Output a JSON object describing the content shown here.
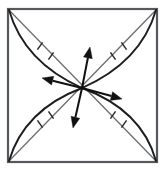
{
  "figure": {
    "background_color": "#ffffff",
    "frame_color": "#55585c",
    "diagonal_color": "#6b6e72",
    "arc_color": "#1d1d1d",
    "vector_color": "#111111",
    "tick_color": "#2a2a2a"
  },
  "chart_data": {
    "type": "diagram",
    "xlabel": "",
    "ylabel": "",
    "xlim": [
      0,
      165
    ],
    "ylim": [
      0,
      177
    ],
    "grid": false,
    "legend": "none",
    "annotations": [],
    "frame": {
      "name": "outer-square",
      "left": 8,
      "top": 9,
      "right": 157,
      "bottom": 162,
      "stroke_width": 2.2
    },
    "center": {
      "x": 82,
      "y": 88
    },
    "diagonals": [
      {
        "name": "diagonal-top-left-to-bottom-right",
        "from": {
          "x": 9,
          "y": 10
        },
        "to": {
          "x": 156,
          "y": 161
        }
      },
      {
        "name": "diagonal-top-right-to-bottom-left",
        "from": {
          "x": 156,
          "y": 10
        },
        "to": {
          "x": 9,
          "y": 161
        }
      }
    ],
    "arcs": [
      {
        "name": "arc-top-left",
        "from": {
          "x": 9,
          "y": 10
        },
        "to": {
          "x": 82,
          "y": 88
        },
        "control": {
          "x": 24,
          "y": 62
        },
        "bow": "outward-left"
      },
      {
        "name": "arc-bottom-right",
        "from": {
          "x": 82,
          "y": 88
        },
        "to": {
          "x": 156,
          "y": 161
        },
        "control": {
          "x": 142,
          "y": 110
        },
        "bow": "outward-right"
      },
      {
        "name": "arc-top-right",
        "from": {
          "x": 156,
          "y": 10
        },
        "to": {
          "x": 82,
          "y": 88
        },
        "control": {
          "x": 141,
          "y": 62
        },
        "bow": "outward-right"
      },
      {
        "name": "arc-bottom-left",
        "from": {
          "x": 82,
          "y": 88
        },
        "to": {
          "x": 9,
          "y": 161
        },
        "control": {
          "x": 24,
          "y": 110
        },
        "bow": "outward-left"
      }
    ],
    "tick_marks": [
      {
        "name": "tick-top-left-outer",
        "x": 40,
        "y": 46,
        "angle_deg": 55,
        "length": 9
      },
      {
        "name": "tick-top-left-inner",
        "x": 51,
        "y": 56,
        "angle_deg": 55,
        "length": 9
      },
      {
        "name": "tick-top-right-outer",
        "x": 124,
        "y": 46,
        "angle_deg": 125,
        "length": 9
      },
      {
        "name": "tick-top-right-inner",
        "x": 113,
        "y": 56,
        "angle_deg": 125,
        "length": 9
      },
      {
        "name": "tick-bottom-left-outer",
        "x": 40,
        "y": 124,
        "angle_deg": 125,
        "length": 9
      },
      {
        "name": "tick-bottom-left-inner",
        "x": 51,
        "y": 115,
        "angle_deg": 125,
        "length": 9
      },
      {
        "name": "tick-bottom-right-outer",
        "x": 124,
        "y": 124,
        "angle_deg": 55,
        "length": 9
      },
      {
        "name": "tick-bottom-right-inner",
        "x": 113,
        "y": 115,
        "angle_deg": 55,
        "length": 9
      }
    ],
    "vectors": [
      {
        "name": "vector-up",
        "direction": "up",
        "from": {
          "x": 82,
          "y": 88
        },
        "to": {
          "x": 90,
          "y": 47
        },
        "length": 42,
        "angle_deg": 79
      },
      {
        "name": "vector-right",
        "direction": "right",
        "from": {
          "x": 82,
          "y": 88
        },
        "to": {
          "x": 122,
          "y": 99
        },
        "length": 41,
        "angle_deg": -15
      },
      {
        "name": "vector-down",
        "direction": "down",
        "from": {
          "x": 82,
          "y": 88
        },
        "to": {
          "x": 73,
          "y": 128
        },
        "length": 41,
        "angle_deg": -103
      },
      {
        "name": "vector-left",
        "direction": "left",
        "from": {
          "x": 82,
          "y": 88
        },
        "to": {
          "x": 42,
          "y": 78
        },
        "length": 41,
        "angle_deg": 166
      }
    ]
  }
}
